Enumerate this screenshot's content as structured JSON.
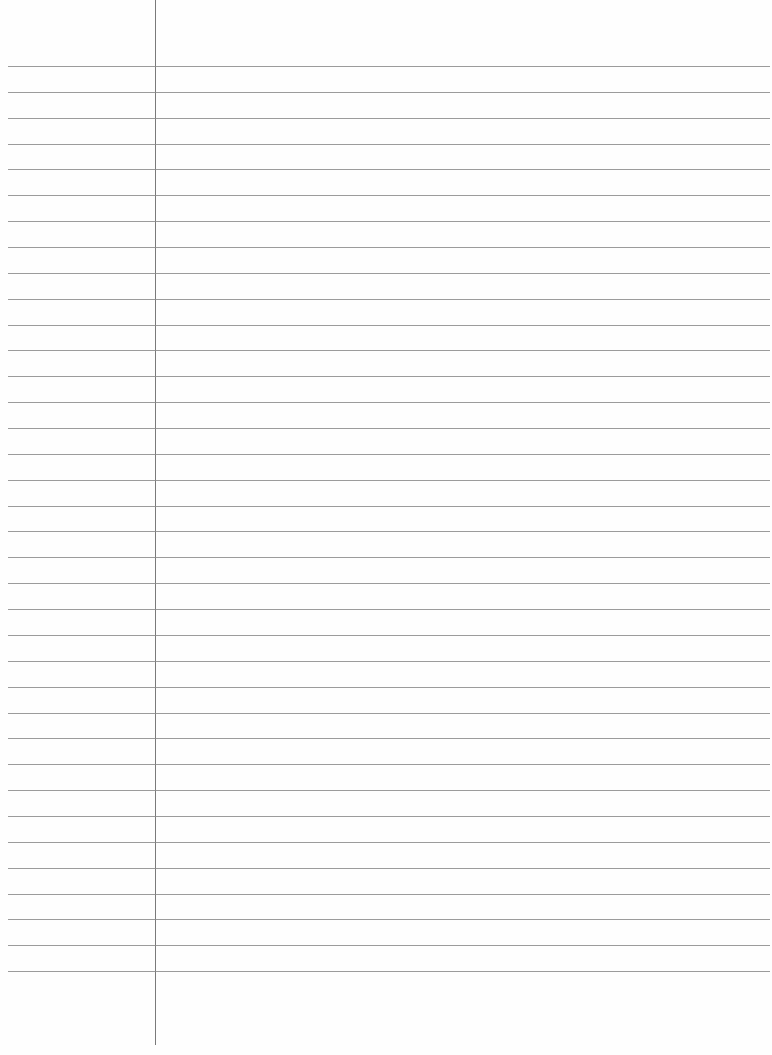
{
  "page": {
    "type": "lined-paper",
    "background": "#fefefe",
    "line_color": "#8a8a8a",
    "margin_line_color": "#7a7a7a",
    "line_count": 36,
    "first_line_y": 66,
    "line_spacing": 25.86,
    "margin_x": 155,
    "text": ""
  }
}
